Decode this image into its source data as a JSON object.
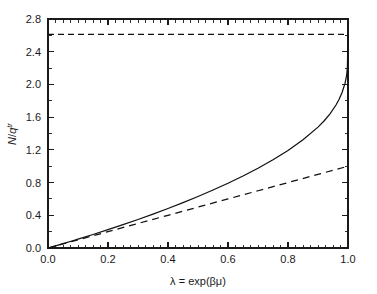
{
  "chart_data": {
    "type": "line",
    "title": "",
    "xlabel": "λ = exp(βμ)",
    "ylabel": "N/q^tr",
    "ylabel_parts": {
      "numerator": "N",
      "slash": "/",
      "denominator": "q",
      "superscript": "tr"
    },
    "xlim": [
      0.0,
      1.0
    ],
    "ylim": [
      0.0,
      2.8
    ],
    "xticks": [
      0.0,
      0.2,
      0.4,
      0.6,
      0.8,
      1.0
    ],
    "xtick_labels": [
      "0.0",
      "0.2",
      "0.4",
      "0.6",
      "0.8",
      "1.0"
    ],
    "yticks": [
      0.0,
      0.4,
      0.8,
      1.2,
      1.6,
      2.0,
      2.4,
      2.8
    ],
    "ytick_labels": [
      "0.0",
      "0.4",
      "0.8",
      "1.2",
      "1.6",
      "2.0",
      "2.4",
      "2.8"
    ],
    "x_minor_tick_interval": 0.025,
    "y_minor_tick_interval": 0.2,
    "grid": false,
    "legend": null,
    "frame": "box",
    "series": [
      {
        "name": "bose-einstein",
        "style": "solid",
        "color": "#111111",
        "x": [
          0.0,
          0.02,
          0.05,
          0.08,
          0.1,
          0.15,
          0.2,
          0.25,
          0.3,
          0.35,
          0.4,
          0.45,
          0.5,
          0.55,
          0.6,
          0.65,
          0.7,
          0.75,
          0.8,
          0.85,
          0.9,
          0.92,
          0.94,
          0.96,
          0.97,
          0.98,
          0.99,
          0.995,
          0.998,
          1.0
        ],
        "values": [
          0.0,
          0.0206,
          0.0526,
          0.0855,
          0.1078,
          0.1648,
          0.2238,
          0.2849,
          0.3483,
          0.4142,
          0.4828,
          0.5545,
          0.6296,
          0.7086,
          0.7921,
          0.8809,
          0.976,
          1.079,
          1.193,
          1.323,
          1.478,
          1.553,
          1.64,
          1.748,
          1.816,
          1.898,
          2.012,
          2.1,
          2.2,
          2.612
        ]
      },
      {
        "name": "classical-lambda",
        "style": "dashed",
        "color": "#111111",
        "x": [
          0.0,
          0.1,
          0.2,
          0.3,
          0.4,
          0.5,
          0.6,
          0.7,
          0.8,
          0.9,
          1.0
        ],
        "values": [
          0.0,
          0.1,
          0.2,
          0.3,
          0.4,
          0.5,
          0.6,
          0.7,
          0.8,
          0.9,
          1.0
        ]
      },
      {
        "name": "asymptote-zeta-3-2",
        "style": "dashed-horizontal",
        "color": "#111111",
        "x": [
          0.0,
          1.0
        ],
        "values": [
          2.612,
          2.612
        ]
      }
    ],
    "annotations": []
  }
}
